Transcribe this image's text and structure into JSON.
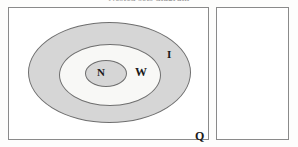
{
  "title": "Nested sets diagram",
  "diagram": {
    "type": "venn-nested-sets",
    "boxes": [
      {
        "id": "q",
        "label": "Q",
        "overline": false,
        "filled": false
      },
      {
        "id": "qbar",
        "label": "Q",
        "overline": true,
        "filled": false
      }
    ],
    "ellipses": [
      {
        "id": "i",
        "label": "I",
        "fill": "#d6d6d6",
        "level": 1
      },
      {
        "id": "w",
        "label": "W",
        "fill": "#f8f8f6",
        "level": 2
      },
      {
        "id": "n",
        "label": "N",
        "fill": "#d6d6d6",
        "level": 3
      }
    ],
    "labels": {
      "n": "N",
      "w": "W",
      "i": "I",
      "q": "Q",
      "qbar": "Q"
    },
    "colors": {
      "shaded": "#d6d6d6",
      "light": "#f8f8f6",
      "stroke": "#6f6f6f",
      "box_border": "#8a8a8a",
      "background": "#ffffff",
      "text": "#1a1a1a"
    }
  }
}
